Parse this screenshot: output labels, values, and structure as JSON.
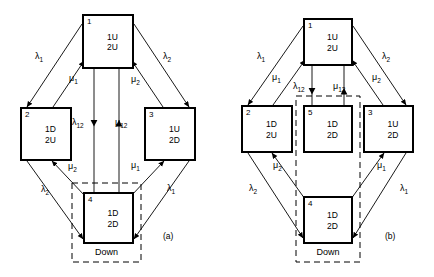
{
  "figure": {
    "type": "markov-state-transition-diagram",
    "panels": [
      {
        "caption": "(a)",
        "caption_pos": {
          "x": 163,
          "y": 232
        },
        "down_group_label": "Down",
        "down_group_pos": {
          "x": 72,
          "y": 243,
          "w": 69,
          "h": 19
        },
        "dashed_region": {
          "x": 72,
          "y": 183,
          "w": 69,
          "h": 79
        },
        "states": [
          {
            "id": "1",
            "line1": "1U",
            "line2": "2U",
            "x": 82,
            "y": 14,
            "w": 52,
            "h": 55
          },
          {
            "id": "2",
            "line1": "1D",
            "line2": "2U",
            "x": 20,
            "y": 107,
            "w": 52,
            "h": 54
          },
          {
            "id": "3",
            "line1": "1U",
            "line2": "2D",
            "x": 144,
            "y": 107,
            "w": 52,
            "h": 54
          },
          {
            "id": "4",
            "line1": "1D",
            "line2": "2D",
            "x": 83,
            "y": 192,
            "w": 51,
            "h": 52
          }
        ],
        "rates": [
          {
            "symbol": "λ",
            "sub": "1",
            "x": 35,
            "y": 52
          },
          {
            "symbol": "μ",
            "sub": "1",
            "x": 69,
            "y": 74
          },
          {
            "symbol": "λ",
            "sub": "2",
            "x": 163,
            "y": 52
          },
          {
            "symbol": "μ",
            "sub": "2",
            "x": 131,
            "y": 75
          },
          {
            "symbol": "λ",
            "sub": "12",
            "x": 72,
            "y": 118
          },
          {
            "symbol": "μ",
            "sub": "12",
            "x": 115,
            "y": 118
          },
          {
            "symbol": "μ",
            "sub": "2",
            "x": 68,
            "y": 162
          },
          {
            "symbol": "λ",
            "sub": "2",
            "x": 41,
            "y": 185
          },
          {
            "symbol": "μ",
            "sub": "1",
            "x": 131,
            "y": 161
          },
          {
            "symbol": "λ",
            "sub": "1",
            "x": 167,
            "y": 184
          }
        ]
      },
      {
        "caption": "(b)",
        "caption_pos": {
          "x": 385,
          "y": 232
        },
        "down_group_label": "Down",
        "down_group_pos": {
          "x": 296,
          "y": 243,
          "w": 64,
          "h": 19
        },
        "dashed_region": {
          "x": 296,
          "y": 96,
          "w": 64,
          "h": 166
        },
        "states": [
          {
            "id": "1",
            "line1": "1U",
            "line2": "2U",
            "x": 303,
            "y": 18,
            "w": 50,
            "h": 48
          },
          {
            "id": "2",
            "line1": "1D",
            "line2": "2U",
            "x": 241,
            "y": 105,
            "w": 52,
            "h": 48
          },
          {
            "id": "5",
            "line1": "1D",
            "line2": "2D",
            "x": 303,
            "y": 105,
            "w": 50,
            "h": 48
          },
          {
            "id": "3",
            "line1": "1U",
            "line2": "2D",
            "x": 363,
            "y": 105,
            "w": 51,
            "h": 48
          },
          {
            "id": "4",
            "line1": "1D",
            "line2": "2D",
            "x": 303,
            "y": 196,
            "w": 50,
            "h": 48
          }
        ],
        "rates": [
          {
            "symbol": "λ",
            "sub": "1",
            "x": 257,
            "y": 52
          },
          {
            "symbol": "μ",
            "sub": "1",
            "x": 272,
            "y": 73
          },
          {
            "symbol": "λ",
            "sub": "2",
            "x": 382,
            "y": 52
          },
          {
            "symbol": "μ",
            "sub": "2",
            "x": 372,
            "y": 73
          },
          {
            "symbol": "λ",
            "sub": "12",
            "x": 293,
            "y": 82
          },
          {
            "symbol": "μ",
            "sub": "12",
            "x": 333,
            "y": 82
          },
          {
            "symbol": "μ",
            "sub": "2",
            "x": 273,
            "y": 161
          },
          {
            "symbol": "λ",
            "sub": "2",
            "x": 249,
            "y": 184
          },
          {
            "symbol": "μ",
            "sub": "1",
            "x": 377,
            "y": 161
          },
          {
            "symbol": "λ",
            "sub": "1",
            "x": 400,
            "y": 184
          }
        ]
      }
    ]
  }
}
